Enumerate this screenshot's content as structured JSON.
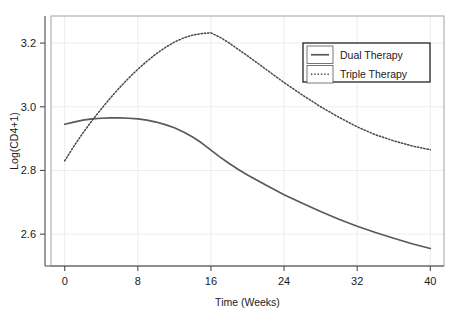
{
  "chart_data": {
    "type": "line",
    "title": "",
    "xlabel": "Time (Weeks)",
    "ylabel": "Log(CD4+1)",
    "xlim": [
      -1.5,
      41.5
    ],
    "ylim": [
      2.5,
      3.285
    ],
    "xticks": [
      0,
      8,
      16,
      24,
      32,
      40
    ],
    "xticklabels": [
      "0",
      "8",
      "16",
      "24",
      "32",
      "40"
    ],
    "yticks": [
      2.6,
      2.8,
      3.0,
      3.2
    ],
    "yticklabels": [
      "2.6",
      "3.0",
      "2.8",
      "3.2"
    ],
    "ytick_labels_ordered": [
      "3.2",
      "3.0",
      "2.8",
      "2.6"
    ],
    "grid": true,
    "legend_position": "top-right",
    "series": [
      {
        "name": "Dual Therapy",
        "style": "solid",
        "color": "#555a5e",
        "x": [
          0,
          1,
          2,
          3,
          4,
          5,
          6,
          7,
          8,
          9,
          10,
          11,
          12,
          13,
          14,
          15,
          16,
          17,
          18,
          19,
          20,
          22,
          24,
          26,
          28,
          30,
          32,
          34,
          36,
          38,
          40
        ],
        "y": [
          2.945,
          2.952,
          2.958,
          2.962,
          2.964,
          2.965,
          2.965,
          2.964,
          2.962,
          2.958,
          2.952,
          2.944,
          2.934,
          2.921,
          2.905,
          2.886,
          2.864,
          2.842,
          2.822,
          2.803,
          2.786,
          2.754,
          2.724,
          2.697,
          2.671,
          2.647,
          2.625,
          2.605,
          2.587,
          2.57,
          2.555
        ]
      },
      {
        "name": "Triple Therapy",
        "style": "dotted",
        "color": "#44484c",
        "x": [
          0,
          1,
          2,
          3,
          4,
          5,
          6,
          7,
          8,
          9,
          10,
          11,
          12,
          13,
          14,
          15,
          16,
          17,
          18,
          19,
          20,
          22,
          24,
          26,
          28,
          30,
          32,
          34,
          36,
          38,
          40
        ],
        "y": [
          2.83,
          2.876,
          2.918,
          2.957,
          2.993,
          3.028,
          3.06,
          3.09,
          3.118,
          3.143,
          3.166,
          3.186,
          3.203,
          3.216,
          3.225,
          3.23,
          3.232,
          3.218,
          3.2,
          3.18,
          3.16,
          3.118,
          3.076,
          3.037,
          3.0,
          2.967,
          2.937,
          2.912,
          2.893,
          2.877,
          2.865
        ]
      }
    ],
    "legend_entries": [
      {
        "label": "Dual Therapy",
        "style": "solid"
      },
      {
        "label": "Triple Therapy",
        "style": "dotted"
      }
    ]
  },
  "geometry": {
    "plot_left": 51,
    "plot_right": 444,
    "plot_top": 16,
    "plot_bottom": 266,
    "legend_x": 303,
    "legend_y": 43,
    "legend_w": 127,
    "legend_h": 39
  }
}
